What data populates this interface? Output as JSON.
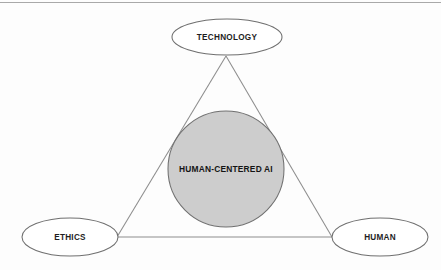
{
  "diagram": {
    "core": {
      "label": "HUMAN-CENTERED AI",
      "fill_color": "#cdcdcd",
      "stroke_color": "#707070",
      "cx": 226,
      "cy": 169,
      "r": 58
    },
    "nodes": [
      {
        "id": "technology",
        "label": "TECHNOLOGY",
        "cx": 227,
        "cy": 37,
        "rx": 55,
        "ry": 18
      },
      {
        "id": "ethics",
        "label": "ETHICS",
        "cx": 70,
        "cy": 237,
        "rx": 48,
        "ry": 19
      },
      {
        "id": "human",
        "label": "HUMAN",
        "cx": 380,
        "cy": 237,
        "rx": 48,
        "ry": 19
      }
    ],
    "edges": [
      {
        "id": "technology-ethics",
        "from": "technology",
        "to": "ethics"
      },
      {
        "id": "technology-human",
        "from": "technology",
        "to": "human"
      },
      {
        "id": "ethics-human",
        "from": "ethics",
        "to": "human"
      }
    ],
    "triangle": {
      "apex_x": 226,
      "apex_y": 56,
      "left_x": 117,
      "left_y": 237,
      "right_x": 332,
      "right_y": 237
    },
    "colors": {
      "line": "#8d8d8d",
      "node_fill": "#ffffff",
      "node_stroke": "#6f6f6f",
      "text": "#1e1e1e",
      "background": "#fdfdfd",
      "scan_rule": "#9a9a9a"
    }
  }
}
